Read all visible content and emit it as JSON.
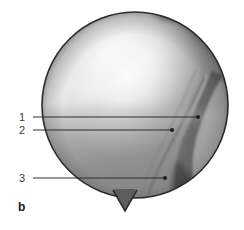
{
  "figure": {
    "panel_letter": "b",
    "modality": "grayscale-endoscopic-circular-image",
    "background_color": "#ffffff",
    "outline_color": "#2b2b2b"
  },
  "image_field": {
    "shape": "circle",
    "center_x": 135,
    "center_y": 105,
    "radius": 93,
    "notch": {
      "name": "bottom-triangular-notch",
      "apex_x": 125,
      "apex_y": 211,
      "left_x": 114,
      "right_x": 136,
      "base_y": 196
    },
    "tones": {
      "highlight": "#f4f4f4",
      "upper_mid": "#b8b8b8",
      "mid": "#8e8e8e",
      "lower_mid": "#858585",
      "dark_band": "#5e5e5e",
      "right_wedge": "#9a9a9a",
      "darkest": "#4a4a4a"
    }
  },
  "annotations": {
    "line_color": "#2e2e2e",
    "dot_color": "#1f1f1f",
    "items": [
      {
        "label": "1",
        "label_x": 22,
        "label_y": 121,
        "line_x1": 33,
        "line_y1": 117,
        "line_x2": 198,
        "line_y2": 117,
        "dot_x": 198,
        "dot_y": 117
      },
      {
        "label": "2",
        "label_x": 22,
        "label_y": 134,
        "line_x1": 33,
        "line_y1": 130,
        "line_x2": 172,
        "line_y2": 130,
        "dot_x": 172,
        "dot_y": 130
      },
      {
        "label": "3",
        "label_x": 22,
        "label_y": 182,
        "line_x1": 33,
        "line_y1": 178,
        "line_x2": 165,
        "line_y2": 178,
        "dot_x": 165,
        "dot_y": 178
      }
    ]
  },
  "panel_label": {
    "text": "b",
    "x": 18,
    "y": 211
  }
}
